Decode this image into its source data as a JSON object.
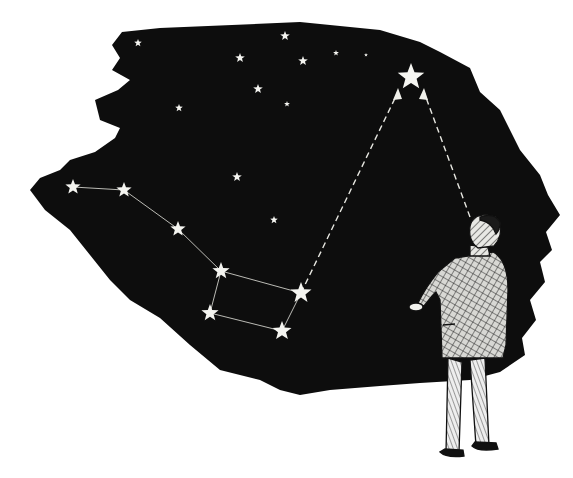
{
  "illustration": {
    "subject": "Man looking up at the night sky; Big Dipper pointer stars lead to the North Star",
    "colors": {
      "sky": "#0d0d0d",
      "star": "#f4f4f0",
      "paper": "#ffffff",
      "ink": "#111111"
    },
    "sky_outline": "M122,32 L160,28 L300,22 L380,30 L420,42 L440,52 L470,68 L480,92 L500,110 L520,150 L540,175 L548,195 L560,215 L546,232 L552,250 L540,262 L545,282 L530,300 L536,320 L522,338 L525,355 L500,372 L470,380 L420,383 L380,386 L330,390 L300,395 L280,390 L260,380 L220,370 L190,345 L160,318 L130,300 L110,280 L90,255 L70,230 L45,210 L30,190 L40,178 L60,170 L70,160 L95,152 L115,138 L120,128 L100,120 L95,100 L118,90 L130,80 L112,70 L120,58 L112,45 Z",
    "big_dipper": [
      {
        "x": 73,
        "y": 187,
        "r": 8
      },
      {
        "x": 124,
        "y": 190,
        "r": 8
      },
      {
        "x": 178,
        "y": 229,
        "r": 8
      },
      {
        "x": 221,
        "y": 271,
        "r": 9
      },
      {
        "x": 301,
        "y": 293,
        "r": 11
      },
      {
        "x": 282,
        "y": 331,
        "r": 10
      },
      {
        "x": 210,
        "y": 313,
        "r": 9
      }
    ],
    "north_star": {
      "x": 411,
      "y": 77,
      "r": 14
    },
    "background_stars": [
      {
        "x": 138,
        "y": 43,
        "r": 4
      },
      {
        "x": 240,
        "y": 58,
        "r": 5
      },
      {
        "x": 285,
        "y": 36,
        "r": 5
      },
      {
        "x": 303,
        "y": 61,
        "r": 5
      },
      {
        "x": 258,
        "y": 89,
        "r": 5
      },
      {
        "x": 336,
        "y": 53,
        "r": 3
      },
      {
        "x": 366,
        "y": 55,
        "r": 2
      },
      {
        "x": 287,
        "y": 104,
        "r": 3
      },
      {
        "x": 179,
        "y": 108,
        "r": 4
      },
      {
        "x": 237,
        "y": 177,
        "r": 5
      },
      {
        "x": 274,
        "y": 220,
        "r": 4
      }
    ],
    "pointer_lines": [
      {
        "x1": 301,
        "y1": 293,
        "x2": 398,
        "y2": 92
      },
      {
        "x1": 470,
        "y1": 217,
        "x2": 424,
        "y2": 92
      }
    ]
  }
}
